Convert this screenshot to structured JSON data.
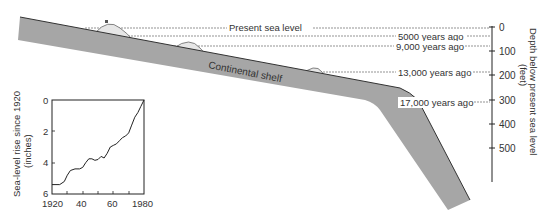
{
  "diagram": {
    "shelf_label": "Continental shelf",
    "sea_levels": [
      {
        "label": "Present sea level",
        "depth_ft": 0
      },
      {
        "label": "5000 years ago",
        "depth_ft": 35
      },
      {
        "label": "9,000 years ago",
        "depth_ft": 75
      },
      {
        "label": "13,000 years ago",
        "depth_ft": 185
      },
      {
        "label": "17,000 years ago",
        "depth_ft": 310
      }
    ],
    "depth_axis": {
      "title_line1": "Depth below present sea level",
      "title_line2": "(feet)",
      "ticks": [
        "0",
        "100",
        "200",
        "300",
        "400",
        "500"
      ]
    },
    "colors": {
      "shelf": "#a6a6a6",
      "shelf_edge": "#333333",
      "mound": "#e6e6e6",
      "line": "#555555"
    }
  },
  "chart_data": {
    "type": "line",
    "title": "",
    "xlabel": "",
    "ylabel": "Sea-level rise since 1920 (inches)",
    "ylabel_line1": "Sea-level rise since 1920",
    "ylabel_line2": "(inches)",
    "x_ticks": [
      "1920",
      "40",
      "60",
      "1980"
    ],
    "y_ticks": [
      "0",
      "2",
      "4",
      "6"
    ],
    "xlim": [
      1920,
      1980
    ],
    "ylim": [
      6,
      0
    ],
    "y_inverted": true,
    "grid": false,
    "x": [
      1920,
      1925,
      1928,
      1930,
      1932,
      1935,
      1938,
      1940,
      1942,
      1944,
      1946,
      1948,
      1950,
      1952,
      1954,
      1956,
      1958,
      1960,
      1962,
      1964,
      1966,
      1968,
      1970,
      1972,
      1974,
      1976,
      1978,
      1980
    ],
    "values": [
      5.4,
      5.4,
      5.2,
      4.8,
      4.5,
      4.4,
      4.4,
      4.3,
      4.0,
      3.75,
      3.75,
      3.85,
      3.8,
      3.6,
      3.7,
      3.4,
      3.0,
      2.9,
      2.8,
      2.6,
      2.4,
      2.3,
      2.1,
      1.6,
      1.1,
      0.8,
      0.4,
      0.0
    ]
  }
}
